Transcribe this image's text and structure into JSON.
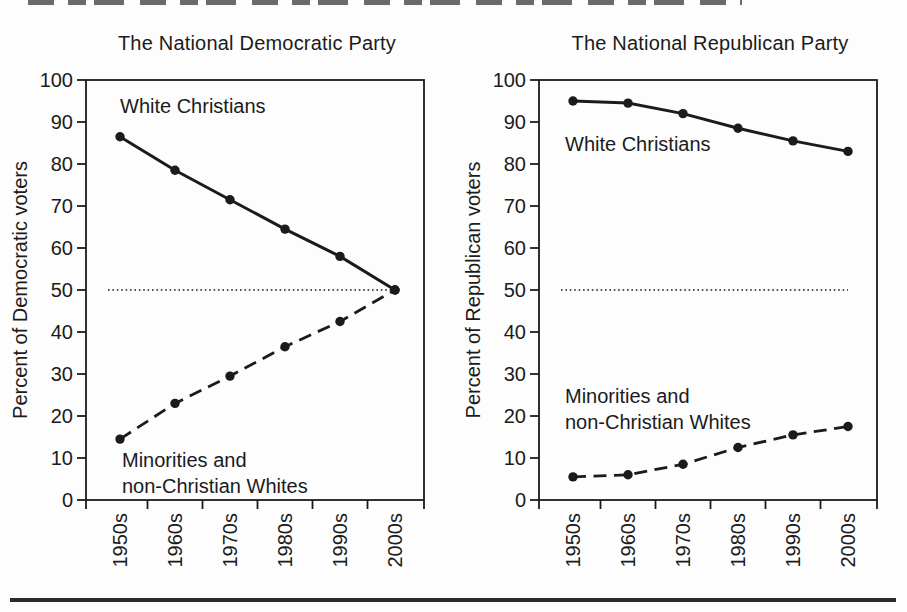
{
  "colors": {
    "ink": "#1b1b1b",
    "background": "#fdfdfd"
  },
  "chart_data": [
    {
      "type": "line",
      "title": "The National Democratic Party",
      "ylabel": "Percent of Democratic voters",
      "xlabel": "",
      "categories": [
        "1950s",
        "1960s",
        "1970s",
        "1980s",
        "1990s",
        "2000s"
      ],
      "ylim": [
        0,
        100
      ],
      "yticks": [
        0,
        10,
        20,
        30,
        40,
        50,
        60,
        70,
        80,
        90,
        100
      ],
      "reference_line": 50,
      "grid": false,
      "legend_position": "in-plot annotations",
      "series": [
        {
          "name": "White Christians",
          "line_style": "solid",
          "marker": "filled-circle",
          "values": [
            86.5,
            78.5,
            71.5,
            64.5,
            58,
            50
          ],
          "label_lines": [
            "White Christians"
          ],
          "label_pos": {
            "x": 120,
            "y": 93
          }
        },
        {
          "name": "Minorities and non-Christian Whites",
          "line_style": "dashed",
          "marker": "filled-circle",
          "values": [
            14.5,
            23,
            29.5,
            36.5,
            42.5,
            50
          ],
          "label_lines": [
            "Minorities and",
            "non-Christian Whites"
          ],
          "label_pos": {
            "x": 122,
            "y": 447
          }
        }
      ]
    },
    {
      "type": "line",
      "title": "The National Republican Party",
      "ylabel": "Percent of Republican voters",
      "xlabel": "",
      "categories": [
        "1950s",
        "1960s",
        "1970s",
        "1980s",
        "1990s",
        "2000s"
      ],
      "ylim": [
        0,
        100
      ],
      "yticks": [
        0,
        10,
        20,
        30,
        40,
        50,
        60,
        70,
        80,
        90,
        100
      ],
      "reference_line": 50,
      "grid": false,
      "legend_position": "in-plot annotations",
      "series": [
        {
          "name": "White Christians",
          "line_style": "solid",
          "marker": "filled-circle",
          "values": [
            95,
            94.5,
            92,
            88.5,
            85.5,
            83
          ],
          "label_lines": [
            "White Christians"
          ],
          "label_pos": {
            "x": 112,
            "y": 131
          }
        },
        {
          "name": "Minorities and non-Christian Whites",
          "line_style": "dashed",
          "marker": "filled-circle",
          "values": [
            5.5,
            6,
            8.5,
            12.5,
            15.5,
            17.5
          ],
          "label_lines": [
            "Minorities and",
            "non-Christian Whites"
          ],
          "label_pos": {
            "x": 112,
            "y": 383
          }
        }
      ]
    }
  ]
}
